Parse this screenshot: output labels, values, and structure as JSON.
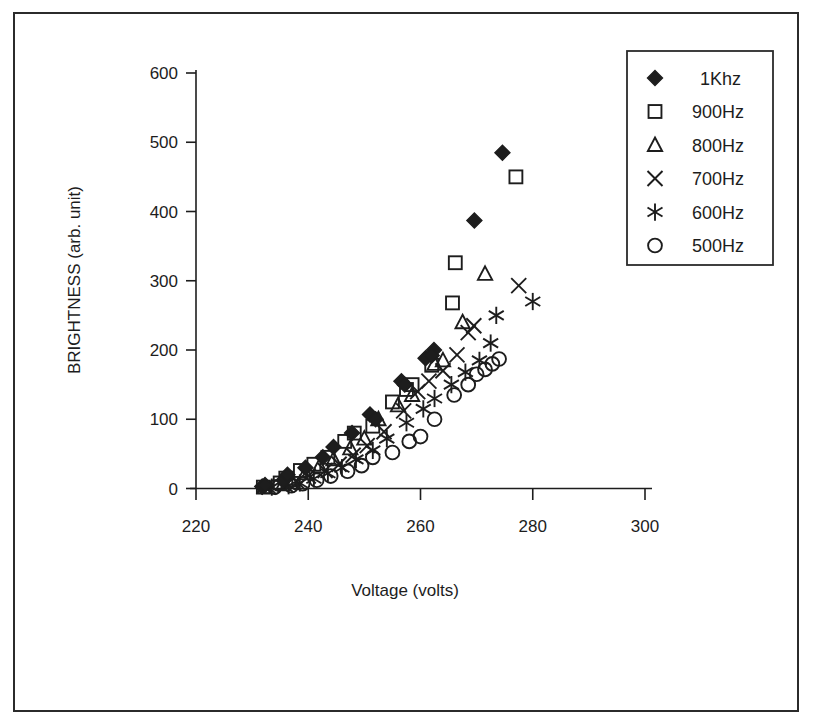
{
  "chart_data": {
    "type": "scatter",
    "title": "",
    "xlabel": "Voltage (volts)",
    "ylabel": "BRIGHTNESS (arb. unit)",
    "xlim": [
      220,
      300
    ],
    "ylim": [
      0,
      600
    ],
    "xticks": [
      220,
      240,
      260,
      280,
      300
    ],
    "yticks": [
      0,
      100,
      200,
      300,
      400,
      500,
      600
    ],
    "grid": false,
    "legend_position": "top-right",
    "series": [
      {
        "name": "1Khz",
        "marker": "filled-diamond",
        "color": "#1d1d1d",
        "points": [
          [
            231.8,
            3
          ],
          [
            232.3,
            5
          ],
          [
            235.6,
            12
          ],
          [
            236.3,
            20
          ],
          [
            239.5,
            30
          ],
          [
            242.6,
            45
          ],
          [
            244.5,
            60
          ],
          [
            247.8,
            80
          ],
          [
            251.0,
            107
          ],
          [
            252.0,
            100
          ],
          [
            256.6,
            155
          ],
          [
            257.2,
            150
          ],
          [
            260.9,
            188
          ],
          [
            262.4,
            200
          ],
          [
            262.0,
            192
          ],
          [
            269.6,
            387
          ],
          [
            274.6,
            485
          ]
        ]
      },
      {
        "name": "900Hz",
        "marker": "open-square",
        "color": "#1d1d1d",
        "points": [
          [
            232.0,
            2
          ],
          [
            235.0,
            8
          ],
          [
            236.0,
            15
          ],
          [
            238.6,
            26
          ],
          [
            241.0,
            35
          ],
          [
            243.5,
            45
          ],
          [
            246.5,
            68
          ],
          [
            248.2,
            80
          ],
          [
            251.5,
            90
          ],
          [
            255.0,
            125
          ],
          [
            257.5,
            143
          ],
          [
            258.5,
            150
          ],
          [
            262.0,
            178
          ],
          [
            265.7,
            268
          ],
          [
            266.2,
            326
          ],
          [
            277.0,
            450
          ]
        ]
      },
      {
        "name": "800Hz",
        "marker": "open-triangle",
        "color": "#1d1d1d",
        "points": [
          [
            232.2,
            2
          ],
          [
            235.5,
            6
          ],
          [
            237.0,
            12
          ],
          [
            239.5,
            22
          ],
          [
            242.0,
            32
          ],
          [
            244.5,
            42
          ],
          [
            247.5,
            58
          ],
          [
            250.0,
            72
          ],
          [
            252.5,
            100
          ],
          [
            256.0,
            120
          ],
          [
            258.5,
            135
          ],
          [
            262.5,
            180
          ],
          [
            264.0,
            185
          ],
          [
            267.5,
            240
          ],
          [
            271.5,
            310
          ]
        ]
      },
      {
        "name": "700Hz",
        "marker": "cross-x",
        "color": "#1d1d1d",
        "points": [
          [
            233.0,
            2
          ],
          [
            236.0,
            5
          ],
          [
            238.0,
            10
          ],
          [
            240.0,
            18
          ],
          [
            243.0,
            26
          ],
          [
            245.5,
            35
          ],
          [
            248.0,
            48
          ],
          [
            250.5,
            62
          ],
          [
            253.5,
            82
          ],
          [
            257.0,
            112
          ],
          [
            259.5,
            140
          ],
          [
            261.5,
            155
          ],
          [
            264.0,
            170
          ],
          [
            266.5,
            193
          ],
          [
            268.5,
            225
          ],
          [
            269.5,
            235
          ],
          [
            277.5,
            293
          ]
        ]
      },
      {
        "name": "600Hz",
        "marker": "asterisk",
        "color": "#1d1d1d",
        "points": [
          [
            233.5,
            2
          ],
          [
            236.5,
            4
          ],
          [
            238.5,
            8
          ],
          [
            241.0,
            14
          ],
          [
            243.5,
            22
          ],
          [
            246.0,
            30
          ],
          [
            248.5,
            42
          ],
          [
            251.5,
            55
          ],
          [
            254.0,
            72
          ],
          [
            257.5,
            95
          ],
          [
            260.5,
            115
          ],
          [
            262.5,
            130
          ],
          [
            265.5,
            150
          ],
          [
            268.0,
            168
          ],
          [
            270.5,
            185
          ],
          [
            272.5,
            210
          ],
          [
            273.5,
            250
          ],
          [
            280.0,
            270
          ]
        ]
      },
      {
        "name": "500Hz",
        "marker": "open-circle",
        "color": "#1d1d1d",
        "points": [
          [
            234.0,
            2
          ],
          [
            237.0,
            4
          ],
          [
            239.0,
            7
          ],
          [
            241.5,
            12
          ],
          [
            244.0,
            18
          ],
          [
            247.0,
            25
          ],
          [
            249.5,
            33
          ],
          [
            251.5,
            45
          ],
          [
            255.0,
            52
          ],
          [
            258.0,
            68
          ],
          [
            260.0,
            75
          ],
          [
            262.5,
            100
          ],
          [
            266.0,
            135
          ],
          [
            268.5,
            150
          ],
          [
            270.0,
            165
          ],
          [
            271.5,
            172
          ],
          [
            272.8,
            180
          ],
          [
            274.0,
            187
          ]
        ]
      }
    ]
  },
  "legend": {
    "entries": [
      {
        "label": "1Khz",
        "marker": "filled-diamond"
      },
      {
        "label": "900Hz",
        "marker": "open-square"
      },
      {
        "label": "800Hz",
        "marker": "open-triangle"
      },
      {
        "label": "700Hz",
        "marker": "cross-x"
      },
      {
        "label": "600Hz",
        "marker": "asterisk"
      },
      {
        "label": "500Hz",
        "marker": "open-circle"
      }
    ]
  },
  "axes": {
    "x_tick_labels": [
      "220",
      "240",
      "260",
      "280",
      "300"
    ],
    "y_tick_labels": [
      "0",
      "100",
      "200",
      "300",
      "400",
      "500",
      "600"
    ],
    "x_title": "Voltage (volts)",
    "y_title": "BRIGHTNESS (arb. unit)"
  }
}
